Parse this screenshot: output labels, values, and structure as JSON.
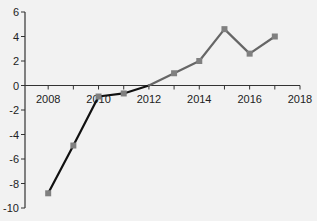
{
  "chart_data": {
    "type": "line",
    "title": "",
    "xlabel": "",
    "ylabel": "",
    "x": [
      2008,
      2009,
      2010,
      2011,
      2012,
      2013,
      2014,
      2015,
      2016,
      2017
    ],
    "series": [
      {
        "name": "series",
        "values": [
          -8.8,
          -4.9,
          -0.9,
          -0.65,
          0.0,
          1.0,
          2.0,
          4.6,
          2.6,
          4.0
        ],
        "segment_colors": {
          "negative_phase": "#111111",
          "positive_phase": "#666666"
        },
        "marker": "square",
        "marker_color": "#808080"
      }
    ],
    "xlim": [
      2007,
      2018
    ],
    "ylim": [
      -10,
      6
    ],
    "xticks": [
      2008,
      2010,
      2012,
      2014,
      2016,
      2018
    ],
    "xticks_minor": [
      2009,
      2011,
      2013,
      2015,
      2017
    ],
    "yticks": [
      6,
      4,
      2,
      0,
      -2,
      -4,
      -6,
      -8,
      -10
    ],
    "x_axis_position": "y=0",
    "grid": false,
    "legend": null
  },
  "colors": {
    "background": "#f2f2f2",
    "axis": "#333333",
    "line_dark": "#111111",
    "line_gray": "#666666",
    "marker": "#808080"
  }
}
